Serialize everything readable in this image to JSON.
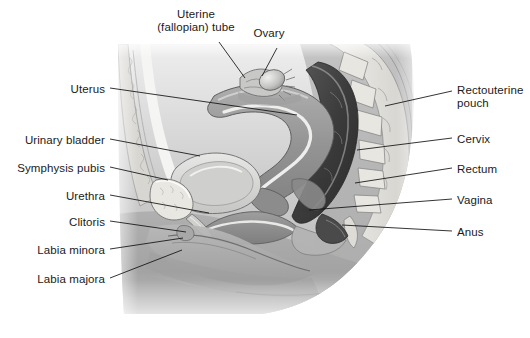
{
  "figure": {
    "type": "anatomical-illustration",
    "style": "grayscale medical line drawing",
    "background_color": "#ffffff",
    "text_color": "#1a1a1a",
    "leader_line_color": "#111111"
  },
  "labels": {
    "top": [
      {
        "id": "uterine-tube",
        "line1": "Uterine",
        "line2": "(fallopian) tube",
        "x": 196,
        "y": 14,
        "align": "center"
      },
      {
        "id": "ovary",
        "line1": "Ovary",
        "line2": "",
        "x": 269,
        "y": 33,
        "align": "center"
      }
    ],
    "left": [
      {
        "id": "uterus",
        "text": "Uterus",
        "x": 105,
        "y": 83
      },
      {
        "id": "urinary-bladder",
        "text": "Urinary bladder",
        "x": 105,
        "y": 134
      },
      {
        "id": "symphysis-pubis",
        "text": "Symphysis pubis",
        "x": 105,
        "y": 162
      },
      {
        "id": "urethra",
        "text": "Urethra",
        "x": 105,
        "y": 190
      },
      {
        "id": "clitoris",
        "text": "Clitoris",
        "x": 105,
        "y": 216
      },
      {
        "id": "labia-minora",
        "text": "Labia minora",
        "x": 105,
        "y": 244
      },
      {
        "id": "labia-majora",
        "text": "Labia majora",
        "x": 105,
        "y": 273
      }
    ],
    "right": [
      {
        "id": "rectouterine-pouch",
        "line1": "Rectouterine",
        "line2": "pouch",
        "x": 457,
        "y": 84
      },
      {
        "id": "cervix",
        "text": "Cervix",
        "x": 457,
        "y": 133
      },
      {
        "id": "rectum",
        "text": "Rectum",
        "x": 457,
        "y": 163
      },
      {
        "id": "vagina",
        "text": "Vagina",
        "x": 457,
        "y": 194
      },
      {
        "id": "anus",
        "text": "Anus",
        "x": 457,
        "y": 226
      }
    ]
  },
  "leader_lines": [
    {
      "id": "leader-uterine-tube",
      "points": "219,42 245,78"
    },
    {
      "id": "leader-ovary",
      "points": "277,48 262,76"
    },
    {
      "id": "leader-uterus",
      "points": "110,88 297,115"
    },
    {
      "id": "leader-urinary-bladder",
      "points": "110,139 200,156"
    },
    {
      "id": "leader-symphysis-pubis",
      "points": "110,167 168,180"
    },
    {
      "id": "leader-urethra",
      "points": "110,195 209,213"
    },
    {
      "id": "leader-clitoris",
      "points": "110,221 186,232"
    },
    {
      "id": "leader-labia-minora",
      "points": "110,249 183,238"
    },
    {
      "id": "leader-labia-majora",
      "points": "110,278 182,250"
    },
    {
      "id": "leader-rectouterine-pouch",
      "points": "452,91 385,106"
    },
    {
      "id": "leader-cervix",
      "points": "452,138 357,150"
    },
    {
      "id": "leader-rectum",
      "points": "452,168 355,183"
    },
    {
      "id": "leader-vagina",
      "points": "452,199 309,210"
    },
    {
      "id": "leader-anus",
      "points": "452,231 342,225"
    }
  ],
  "palette": {
    "skin_light": "#d2d2d2",
    "skin_mid": "#b8b8b8",
    "skin_dark": "#9a9a9a",
    "organ_mid": "#9d9d9d",
    "organ_dark": "#6f6f6f",
    "organ_darkest": "#3a3a3a",
    "bone_light": "#e4e2de",
    "bone_outline": "#7a7a7a",
    "highlight": "#f2f2f0",
    "cavity_black": "#2a2a2a"
  },
  "structures": [
    "uterine (fallopian) tube",
    "ovary",
    "uterus",
    "urinary bladder",
    "symphysis pubis",
    "urethra",
    "clitoris",
    "labia minora",
    "labia majora",
    "rectouterine pouch",
    "cervix",
    "rectum",
    "vagina",
    "anus",
    "sacrum / vertebral column",
    "abdominal wall"
  ]
}
